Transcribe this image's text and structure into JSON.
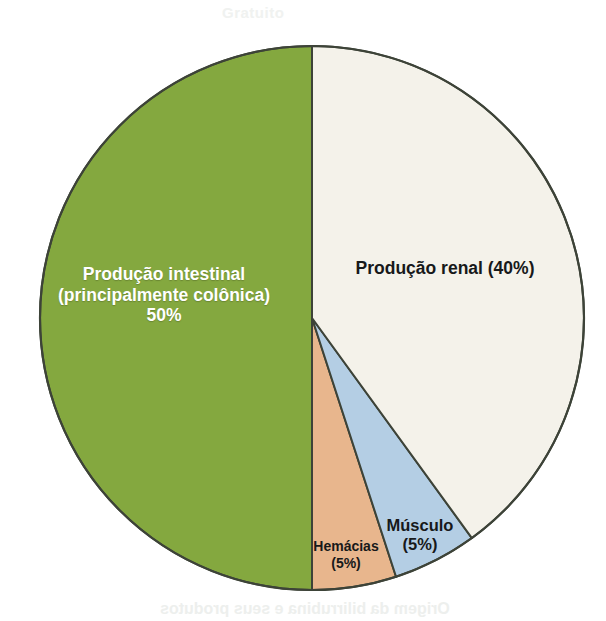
{
  "figure": {
    "background_color": "#ffffff",
    "caption_bleed_top": "Gratuito",
    "caption_bleed_bottom": "Origem da bilirrubina e seus produtos"
  },
  "chart_data": {
    "type": "pie",
    "title": "",
    "subtitle": "",
    "xlabel": "",
    "ylabel": "",
    "legend_position": "none",
    "grid": false,
    "total": 100,
    "units": "%",
    "center": {
      "x": 312,
      "y": 318
    },
    "radius": 272,
    "start_angle_deg": 0,
    "direction": "counterclockwise",
    "categories": [
      "Produção intestinal (principalmente colônica)",
      "Hemácias",
      "Músculo",
      "Produção renal"
    ],
    "values": [
      50,
      5,
      5,
      40
    ],
    "colors": [
      "#84a83f",
      "#e8b68d",
      "#b4cee4",
      "#f4f2ea"
    ],
    "slices": [
      {
        "name": "producao-intestinal",
        "value": 50,
        "value_text": "50%",
        "color": "#84a83f",
        "border_color": "#3d4338",
        "label_color": "#ffffff",
        "label_lines": [
          "Produção intestinal",
          "(principalmente colônica)",
          "50%"
        ],
        "start_deg": 0,
        "end_deg": 180
      },
      {
        "name": "hemacias",
        "value": 5,
        "value_text": "(5%)",
        "color": "#e8b68d",
        "border_color": "#3d4338",
        "label_color": "#17191a",
        "label_lines": [
          "Hemácias",
          "(5%)"
        ],
        "start_deg": 180,
        "end_deg": 198
      },
      {
        "name": "musculo",
        "value": 5,
        "value_text": "(5%)",
        "color": "#b4cee4",
        "border_color": "#3d4338",
        "label_color": "#17191a",
        "label_lines": [
          "Músculo",
          "(5%)"
        ],
        "start_deg": 198,
        "end_deg": 216
      },
      {
        "name": "producao-renal",
        "value": 40,
        "value_text": "(40%)",
        "color": "#f4f2ea",
        "border_color": "#3d4338",
        "label_color": "#17191a",
        "label_lines": [
          "Produção renal (40%)"
        ],
        "start_deg": 216,
        "end_deg": 360
      }
    ]
  },
  "labels": {
    "intestinal": {
      "line1": "Produção intestinal",
      "line2": "(principalmente colônica)",
      "line3": "50%"
    },
    "renal": {
      "line1": "Produção renal (40%)"
    },
    "musculo": {
      "line1": "Músculo",
      "line2": "(5%)"
    },
    "hemacias": {
      "line1": "Hemácias",
      "line2": "(5%)"
    }
  }
}
